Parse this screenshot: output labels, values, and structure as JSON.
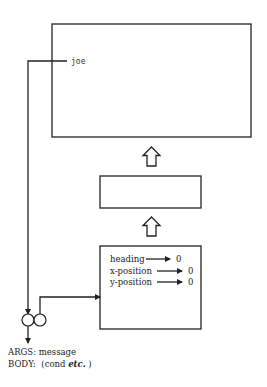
{
  "diagram": {
    "pointer_label": "joe",
    "boxes": [
      {
        "id": "top-object",
        "x": 52,
        "y": 24,
        "w": 199,
        "h": 113
      },
      {
        "id": "middle-object",
        "x": 100,
        "y": 176,
        "w": 101,
        "h": 32
      },
      {
        "id": "bottom-object",
        "x": 100,
        "y": 246,
        "w": 101,
        "h": 83
      }
    ],
    "slots": [
      {
        "name": "heading",
        "value": "0"
      },
      {
        "name": "x-position",
        "value": "0"
      },
      {
        "name": "y-position",
        "value": "0"
      }
    ],
    "procedure": {
      "args_label": "ARGS:",
      "args_value": "message",
      "body_label": "BODY:",
      "body_prefix": "(cond ",
      "body_emphasis": "etc.",
      "body_suffix": ")"
    },
    "colors": {
      "stroke": "#222222",
      "background": "#ffffff"
    }
  }
}
